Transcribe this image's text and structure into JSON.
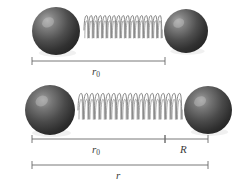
{
  "figure": {
    "background_color": "#ffffff",
    "width": 242,
    "height": 182,
    "line_color": "#6a6a6a",
    "label_color": "#3a3a3a",
    "sphere": {
      "fill_dark": "#2b2b2b",
      "fill_mid": "#4a4a4a",
      "highlight": "#9a9a9a",
      "icon": "atom-sphere-icon"
    },
    "spring": {
      "stroke_color": "#8a8a8a",
      "icon": "coil-spring-icon"
    }
  },
  "rows": [
    {
      "id": "equilibrium",
      "name": "equilibrium-row",
      "spheres": [
        {
          "name": "left-atom",
          "cx": 56,
          "cy": 31,
          "r": 24
        },
        {
          "name": "right-atom",
          "cx": 186,
          "cy": 31,
          "r": 22
        }
      ],
      "spring": {
        "x1": 84,
        "x2": 162,
        "cy": 30,
        "coils": 17,
        "amplitude": 13
      },
      "dimensions": [
        {
          "name": "dimension-r0-equilibrium",
          "label": "r",
          "subscript": "0",
          "x1": 32,
          "x2": 165,
          "y": 61,
          "label_x": 92,
          "label_y": 66
        }
      ]
    },
    {
      "id": "stretched",
      "name": "stretched-row",
      "spheres": [
        {
          "name": "left-atom",
          "cx": 50,
          "cy": 110,
          "r": 25
        },
        {
          "name": "right-atom",
          "cx": 208,
          "cy": 110,
          "r": 24
        }
      ],
      "spring": {
        "x1": 78,
        "x2": 182,
        "cy": 110,
        "coils": 19,
        "amplitude": 15
      },
      "dimensions": [
        {
          "name": "dimension-r0-stretched",
          "label": "r",
          "subscript": "0",
          "x1": 32,
          "x2": 165,
          "y": 139,
          "label_x": 92,
          "label_y": 144
        },
        {
          "name": "dimension-R",
          "label": "R",
          "subscript": "",
          "x1": 165,
          "x2": 208,
          "y": 139,
          "label_x": 180,
          "label_y": 144
        },
        {
          "name": "dimension-r-total",
          "label": "r",
          "subscript": "",
          "x1": 32,
          "x2": 208,
          "y": 165,
          "label_x": 116,
          "label_y": 170
        }
      ]
    }
  ]
}
